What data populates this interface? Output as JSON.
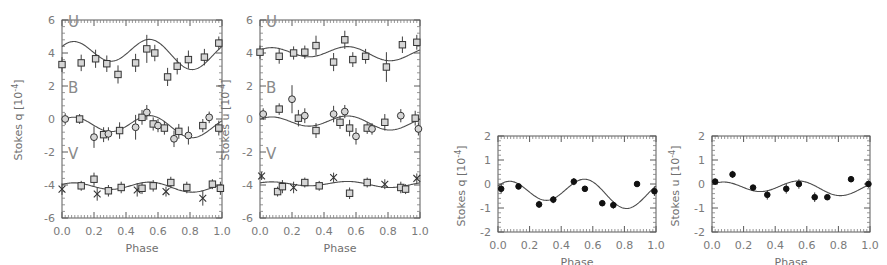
{
  "figure": {
    "background": "#ffffff",
    "axis_color": "#5a5a5a",
    "line_color": "#4d4d4d",
    "marker_open_fill": "#d6d6d6",
    "marker_filled": "#111111"
  },
  "panels": [
    {
      "id": "panel-q-ubv",
      "ylabel": "Stokes q [10",
      "yexp": "-4",
      "ylabel_close": "]",
      "xlabel": "Phase",
      "xticks": [
        "0.0",
        "0.2",
        "0.4",
        "0.6",
        "0.8",
        "1.0"
      ],
      "yticks": [
        "6",
        "4",
        "2",
        "0",
        "-2",
        "-4",
        "-6"
      ],
      "band_labels": [
        "U",
        "B",
        "V"
      ]
    },
    {
      "id": "panel-u-ubv",
      "ylabel": "Stokes u [10",
      "yexp": "-4",
      "ylabel_close": "]",
      "xlabel": "Phase",
      "xticks": [
        "0.0",
        "0.2",
        "0.4",
        "0.6",
        "0.8",
        "1.0"
      ],
      "yticks": [
        "6",
        "4",
        "2",
        "0",
        "-2",
        "-4",
        "-6"
      ],
      "band_labels": [
        "U",
        "B",
        "V"
      ]
    },
    {
      "id": "panel-q-single",
      "ylabel": "Stokes q [10",
      "yexp": "-4",
      "ylabel_close": "]",
      "xlabel": "Phase",
      "xticks": [
        "0.0",
        "0.2",
        "0.4",
        "0.6",
        "0.8",
        "1.0"
      ],
      "yticks": [
        "2",
        "1",
        "0",
        "-1",
        "-2"
      ],
      "band_labels": []
    },
    {
      "id": "panel-u-single",
      "ylabel": "Stokes u [10",
      "yexp": "-4",
      "ylabel_close": "]",
      "xlabel": "Phase",
      "xticks": [
        "0.0",
        "0.2",
        "0.4",
        "0.6",
        "0.8",
        "1.0"
      ],
      "yticks": [
        "2",
        "1",
        "0",
        "-1",
        "-2"
      ],
      "band_labels": []
    }
  ],
  "chart_data": [
    {
      "type": "scatter",
      "title": "",
      "xlabel": "Phase",
      "ylabel": "Stokes q [10^-4]",
      "xlim": [
        0.0,
        1.0
      ],
      "ylim": [
        -6,
        6
      ],
      "grid": false,
      "legend": "none",
      "note": "Three bands offset vertically: U about +4, B about 0, V about -4",
      "series": [
        {
          "name": "U",
          "marker": "open-square",
          "points": [
            {
              "x": 0.0,
              "y": 3.3,
              "err": 0.45
            },
            {
              "x": 0.12,
              "y": 3.4,
              "err": 0.5
            },
            {
              "x": 0.21,
              "y": 3.65,
              "err": 0.55
            },
            {
              "x": 0.28,
              "y": 3.35,
              "err": 0.5
            },
            {
              "x": 0.35,
              "y": 2.7,
              "err": 0.55
            },
            {
              "x": 0.46,
              "y": 3.4,
              "err": 0.55
            },
            {
              "x": 0.53,
              "y": 4.25,
              "err": 0.85
            },
            {
              "x": 0.58,
              "y": 4.0,
              "err": 0.5
            },
            {
              "x": 0.66,
              "y": 2.55,
              "err": 0.55
            },
            {
              "x": 0.72,
              "y": 3.2,
              "err": 0.5
            },
            {
              "x": 0.79,
              "y": 3.6,
              "err": 0.55
            },
            {
              "x": 0.89,
              "y": 3.75,
              "err": 0.5
            },
            {
              "x": 0.98,
              "y": 4.6,
              "err": 0.4
            }
          ],
          "fit": {
            "mean": 4.0,
            "amplitude": 0.75,
            "harmonics": 2
          }
        },
        {
          "name": "B",
          "marker": "mixed-circle-square",
          "points": [
            {
              "x": 0.02,
              "y": 0.0,
              "err": 0.35
            },
            {
              "x": 0.11,
              "y": 0.0,
              "err": 0.3
            },
            {
              "x": 0.2,
              "y": -1.1,
              "err": 0.65
            },
            {
              "x": 0.26,
              "y": -0.95,
              "err": 0.45
            },
            {
              "x": 0.29,
              "y": -0.9,
              "err": 0.4
            },
            {
              "x": 0.36,
              "y": -0.7,
              "err": 0.5
            },
            {
              "x": 0.46,
              "y": -0.5,
              "err": 0.75
            },
            {
              "x": 0.5,
              "y": 0.1,
              "err": 0.45
            },
            {
              "x": 0.53,
              "y": 0.4,
              "err": 0.45
            },
            {
              "x": 0.57,
              "y": -0.3,
              "err": 0.4
            },
            {
              "x": 0.6,
              "y": -0.4,
              "err": 0.4
            },
            {
              "x": 0.64,
              "y": -0.55,
              "err": 0.4
            },
            {
              "x": 0.7,
              "y": -1.2,
              "err": 0.5
            },
            {
              "x": 0.73,
              "y": -0.75,
              "err": 0.45
            },
            {
              "x": 0.79,
              "y": -1.0,
              "err": 0.55
            },
            {
              "x": 0.88,
              "y": -0.4,
              "err": 0.4
            },
            {
              "x": 0.92,
              "y": 0.1,
              "err": 0.35
            },
            {
              "x": 0.98,
              "y": -0.55,
              "err": 0.45
            }
          ],
          "fit": {
            "mean": -0.4,
            "amplitude": 0.55,
            "harmonics": 2
          }
        },
        {
          "name": "V",
          "marker": "mixed-square-x",
          "points": [
            {
              "x": 0.0,
              "y": -4.25,
              "err": 0.35
            },
            {
              "x": 0.12,
              "y": -4.05,
              "err": 0.3
            },
            {
              "x": 0.2,
              "y": -3.65,
              "err": 0.4
            },
            {
              "x": 0.22,
              "y": -4.55,
              "err": 0.4
            },
            {
              "x": 0.29,
              "y": -4.35,
              "err": 0.35
            },
            {
              "x": 0.37,
              "y": -4.15,
              "err": 0.35
            },
            {
              "x": 0.47,
              "y": -4.3,
              "err": 0.4
            },
            {
              "x": 0.5,
              "y": -4.2,
              "err": 0.35
            },
            {
              "x": 0.57,
              "y": -4.05,
              "err": 0.35
            },
            {
              "x": 0.65,
              "y": -4.4,
              "err": 0.3
            },
            {
              "x": 0.68,
              "y": -3.85,
              "err": 0.35
            },
            {
              "x": 0.78,
              "y": -4.15,
              "err": 0.35
            },
            {
              "x": 0.88,
              "y": -4.8,
              "err": 0.45
            },
            {
              "x": 0.94,
              "y": -3.95,
              "err": 0.3
            },
            {
              "x": 0.99,
              "y": -4.2,
              "err": 0.4
            }
          ],
          "fit": {
            "mean": -4.1,
            "amplitude": 0.25,
            "harmonics": 2
          }
        }
      ]
    },
    {
      "type": "scatter",
      "title": "",
      "xlabel": "Phase",
      "ylabel": "Stokes u [10^-4]",
      "xlim": [
        0.0,
        1.0
      ],
      "ylim": [
        -6,
        6
      ],
      "grid": false,
      "legend": "none",
      "note": "Three bands offset vertically: U about +4, B about 0, V about -4",
      "series": [
        {
          "name": "U",
          "marker": "open-square",
          "points": [
            {
              "x": 0.0,
              "y": 4.05,
              "err": 0.4
            },
            {
              "x": 0.12,
              "y": 3.8,
              "err": 0.45
            },
            {
              "x": 0.21,
              "y": 4.0,
              "err": 0.4
            },
            {
              "x": 0.28,
              "y": 4.05,
              "err": 0.4
            },
            {
              "x": 0.35,
              "y": 4.45,
              "err": 0.6
            },
            {
              "x": 0.46,
              "y": 3.45,
              "err": 0.55
            },
            {
              "x": 0.53,
              "y": 4.8,
              "err": 0.55
            },
            {
              "x": 0.58,
              "y": 3.6,
              "err": 0.45
            },
            {
              "x": 0.66,
              "y": 3.8,
              "err": 0.45
            },
            {
              "x": 0.79,
              "y": 3.15,
              "err": 0.9
            },
            {
              "x": 0.89,
              "y": 4.5,
              "err": 0.5
            },
            {
              "x": 0.98,
              "y": 4.65,
              "err": 0.45
            }
          ],
          "fit": {
            "mean": 4.0,
            "amplitude": 0.35,
            "harmonics": 2
          }
        },
        {
          "name": "B",
          "marker": "mixed-circle-square",
          "points": [
            {
              "x": 0.02,
              "y": 0.3,
              "err": 0.35
            },
            {
              "x": 0.12,
              "y": 0.6,
              "err": 0.35
            },
            {
              "x": 0.2,
              "y": 1.2,
              "err": 0.85
            },
            {
              "x": 0.24,
              "y": 0.05,
              "err": 0.5
            },
            {
              "x": 0.28,
              "y": 0.2,
              "err": 0.45
            },
            {
              "x": 0.35,
              "y": -0.7,
              "err": 0.45
            },
            {
              "x": 0.46,
              "y": 0.3,
              "err": 0.5
            },
            {
              "x": 0.5,
              "y": -0.2,
              "err": 0.4
            },
            {
              "x": 0.53,
              "y": 0.45,
              "err": 0.4
            },
            {
              "x": 0.56,
              "y": -0.55,
              "err": 0.5
            },
            {
              "x": 0.6,
              "y": -1.05,
              "err": 0.5
            },
            {
              "x": 0.67,
              "y": -0.55,
              "err": 0.35
            },
            {
              "x": 0.7,
              "y": -0.6,
              "err": 0.35
            },
            {
              "x": 0.78,
              "y": -0.2,
              "err": 0.5
            },
            {
              "x": 0.88,
              "y": 0.2,
              "err": 0.4
            },
            {
              "x": 0.97,
              "y": 0.05,
              "err": 0.45
            },
            {
              "x": 0.99,
              "y": -0.6,
              "err": 0.4
            }
          ],
          "fit": {
            "mean": -0.2,
            "amplitude": 0.35,
            "harmonics": 2
          }
        },
        {
          "name": "V",
          "marker": "mixed-square-x",
          "points": [
            {
              "x": 0.01,
              "y": -3.45,
              "err": 0.25
            },
            {
              "x": 0.11,
              "y": -4.4,
              "err": 0.3
            },
            {
              "x": 0.14,
              "y": -4.1,
              "err": 0.4
            },
            {
              "x": 0.21,
              "y": -4.15,
              "err": 0.35
            },
            {
              "x": 0.28,
              "y": -3.85,
              "err": 0.3
            },
            {
              "x": 0.37,
              "y": -4.05,
              "err": 0.3
            },
            {
              "x": 0.46,
              "y": -3.55,
              "err": 0.3
            },
            {
              "x": 0.56,
              "y": -4.5,
              "err": 0.35
            },
            {
              "x": 0.67,
              "y": -3.85,
              "err": 0.3
            },
            {
              "x": 0.78,
              "y": -3.95,
              "err": 0.3
            },
            {
              "x": 0.88,
              "y": -4.15,
              "err": 0.35
            },
            {
              "x": 0.91,
              "y": -4.25,
              "err": 0.3
            },
            {
              "x": 0.98,
              "y": -3.6,
              "err": 0.3
            }
          ],
          "fit": {
            "mean": -3.95,
            "amplitude": 0.15,
            "harmonics": 2
          }
        }
      ]
    },
    {
      "type": "scatter",
      "title": "",
      "xlabel": "Phase",
      "ylabel": "Stokes q [10^-4]",
      "xlim": [
        0.0,
        1.0
      ],
      "ylim": [
        -2,
        2
      ],
      "grid": false,
      "legend": "none",
      "series": [
        {
          "name": "q",
          "marker": "filled-circle",
          "points": [
            {
              "x": 0.02,
              "y": -0.2,
              "err": 0.2
            },
            {
              "x": 0.13,
              "y": -0.1,
              "err": 0.12
            },
            {
              "x": 0.26,
              "y": -0.85,
              "err": 0.15
            },
            {
              "x": 0.35,
              "y": -0.65,
              "err": 0.15
            },
            {
              "x": 0.48,
              "y": 0.1,
              "err": 0.15
            },
            {
              "x": 0.55,
              "y": -0.2,
              "err": 0.12
            },
            {
              "x": 0.66,
              "y": -0.8,
              "err": 0.12
            },
            {
              "x": 0.73,
              "y": -0.88,
              "err": 0.15
            },
            {
              "x": 0.88,
              "y": 0.0,
              "err": 0.12
            },
            {
              "x": 0.99,
              "y": -0.3,
              "err": 0.2
            }
          ],
          "fit": {
            "mean": -0.35,
            "amplitude": 0.5,
            "harmonics": 2
          }
        }
      ]
    },
    {
      "type": "scatter",
      "title": "",
      "xlabel": "Phase",
      "ylabel": "Stokes u [10^-4]",
      "xlim": [
        0.0,
        1.0
      ],
      "ylim": [
        -2,
        2
      ],
      "grid": false,
      "legend": "none",
      "series": [
        {
          "name": "u",
          "marker": "filled-circle",
          "points": [
            {
              "x": 0.02,
              "y": 0.1,
              "err": 0.12
            },
            {
              "x": 0.13,
              "y": 0.4,
              "err": 0.15
            },
            {
              "x": 0.26,
              "y": -0.15,
              "err": 0.1
            },
            {
              "x": 0.35,
              "y": -0.45,
              "err": 0.2
            },
            {
              "x": 0.47,
              "y": -0.2,
              "err": 0.2
            },
            {
              "x": 0.55,
              "y": 0.0,
              "err": 0.2
            },
            {
              "x": 0.65,
              "y": -0.55,
              "err": 0.2
            },
            {
              "x": 0.73,
              "y": -0.55,
              "err": 0.08
            },
            {
              "x": 0.88,
              "y": 0.2,
              "err": 0.12
            },
            {
              "x": 0.99,
              "y": 0.0,
              "err": 0.15
            }
          ],
          "fit": {
            "mean": -0.15,
            "amplitude": 0.25,
            "harmonics": 2
          }
        }
      ]
    }
  ]
}
